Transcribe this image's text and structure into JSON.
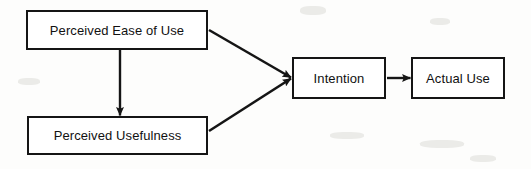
{
  "diagram": {
    "type": "flow-diagram",
    "background_color": "#fdfdfc",
    "line_color": "#151515",
    "text_color": "#111111",
    "nodes": [
      {
        "id": "peou",
        "label": "Perceived Ease of Use",
        "x": 26,
        "y": 10,
        "width": 182,
        "height": 40
      },
      {
        "id": "pu",
        "label": "Perceived Usefulness",
        "x": 27,
        "y": 116,
        "width": 181,
        "height": 39
      },
      {
        "id": "intention",
        "label": "Intention",
        "x": 292,
        "y": 57,
        "width": 94,
        "height": 42
      },
      {
        "id": "actual_use",
        "label": "Actual Use",
        "x": 411,
        "y": 57,
        "width": 94,
        "height": 42
      }
    ],
    "edges": [
      {
        "id": "peou-to-pu",
        "from": "peou",
        "to": "pu",
        "orientation": "vertical",
        "arrowhead": true
      },
      {
        "id": "peou-to-intention",
        "from": "peou",
        "to": "intention",
        "orientation": "diagonal-down",
        "arrowhead": true
      },
      {
        "id": "pu-to-intention",
        "from": "pu",
        "to": "intention",
        "orientation": "diagonal-up",
        "arrowhead": true
      },
      {
        "id": "intention-to-actual-use",
        "from": "intention",
        "to": "actual_use",
        "orientation": "horizontal",
        "arrowhead": true
      }
    ]
  }
}
